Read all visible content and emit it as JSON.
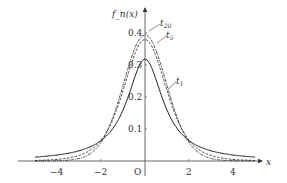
{
  "chart_data": {
    "type": "line",
    "title": "",
    "xlabel": "x",
    "ylabel": "f_n(x)",
    "origin_label": "O",
    "xlim": [
      -5.2,
      5.2
    ],
    "ylim": [
      0,
      0.42
    ],
    "grid": false,
    "x_ticks": [
      -4,
      -2,
      2,
      4
    ],
    "x_tick_labels": [
      "−4",
      "−2",
      "2",
      "4"
    ],
    "y_ticks": [
      0.1,
      0.2,
      0.3,
      0.4
    ],
    "y_tick_labels": [
      "0.1",
      "0.2",
      "0.3",
      "0.4"
    ],
    "x": [
      -5,
      -4,
      -3,
      -2,
      -1,
      0,
      1,
      2,
      3,
      4,
      5
    ],
    "series": [
      {
        "name": "t1",
        "label_main": "t",
        "label_sub": "1",
        "style": "solid",
        "values": [
          0.0122,
          0.0187,
          0.0318,
          0.0637,
          0.1592,
          0.3183,
          0.1592,
          0.0637,
          0.0318,
          0.0187,
          0.0122
        ]
      },
      {
        "name": "t5",
        "label_main": "t",
        "label_sub": "5",
        "style": "dashed",
        "values": [
          0.0018,
          0.0051,
          0.0173,
          0.0651,
          0.2197,
          0.3796,
          0.2197,
          0.0651,
          0.0173,
          0.0051,
          0.0018
        ]
      },
      {
        "name": "t20",
        "label_main": "t",
        "label_sub": "20",
        "style": "dashdot",
        "values": [
          3e-05,
          0.0005,
          0.0059,
          0.0581,
          0.236,
          0.394,
          0.236,
          0.0581,
          0.0059,
          0.0005,
          3e-05
        ]
      }
    ],
    "legend": "inline labels near curves"
  }
}
